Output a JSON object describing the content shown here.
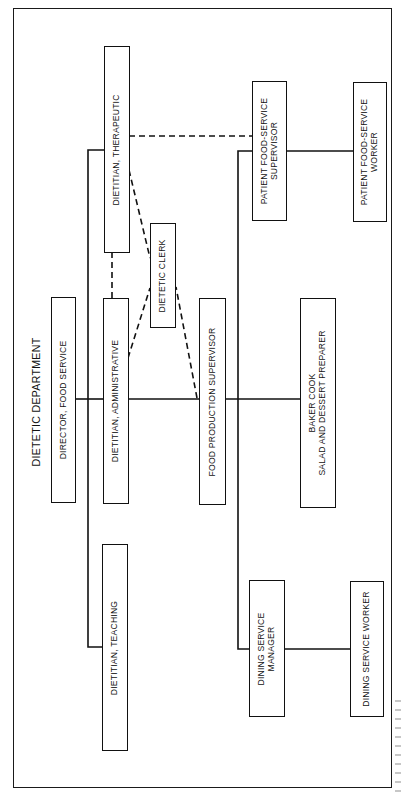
{
  "diagram": {
    "title": "DIETETIC DEPARTMENT",
    "orientation": "rotated 90 degrees counter-clockwise (text reads bottom-to-top)",
    "colors": {
      "line": "#111111",
      "background": "#ffffff"
    },
    "nodes": {
      "director": {
        "label": "DIRECTOR, FOOD SERVICE"
      },
      "dietitian_therapeutic": {
        "label": "DIETITIAN, THERAPEUTIC"
      },
      "dietitian_administrative": {
        "label": "DIETITIAN, ADMINISTRATIVE"
      },
      "dietitian_teaching": {
        "label": "DIETITIAN, TEACHING"
      },
      "dietetic_clerk": {
        "label": "DIETETIC CLERK"
      },
      "food_production_supervisor": {
        "label": "FOOD PRODUCTION SUPERVISOR"
      },
      "patient_food_service_supervisor": {
        "label": "PATIENT FOOD-SERVICE\nSUPERVISOR"
      },
      "patient_food_service_worker": {
        "label": "PATIENT FOOD-SERVICE\nWORKER"
      },
      "baker_cook": {
        "label": "BAKER COOK\nSALAD AND DESSERT PREPARER"
      },
      "dining_service_manager": {
        "label": "DINING SERVICE\nMANAGER"
      },
      "dining_service_worker": {
        "label": "DINING SERVICE WORKER"
      }
    },
    "edges": [
      {
        "from": "director",
        "to": "dietitian_therapeutic",
        "style": "solid"
      },
      {
        "from": "director",
        "to": "dietitian_administrative",
        "style": "solid"
      },
      {
        "from": "director",
        "to": "dietitian_teaching",
        "style": "solid"
      },
      {
        "from": "dietitian_administrative",
        "to": "food_production_supervisor",
        "style": "solid"
      },
      {
        "from": "food_production_supervisor",
        "to": "patient_food_service_supervisor",
        "style": "solid"
      },
      {
        "from": "food_production_supervisor",
        "to": "baker_cook",
        "style": "solid"
      },
      {
        "from": "food_production_supervisor",
        "to": "dining_service_manager",
        "style": "solid"
      },
      {
        "from": "patient_food_service_supervisor",
        "to": "patient_food_service_worker",
        "style": "solid"
      },
      {
        "from": "dining_service_manager",
        "to": "dining_service_worker",
        "style": "solid"
      },
      {
        "from": "dietitian_therapeutic",
        "to": "dietitian_administrative",
        "style": "dashed"
      },
      {
        "from": "dietitian_therapeutic",
        "to": "patient_food_service_supervisor",
        "style": "dashed"
      },
      {
        "from": "dietitian_therapeutic",
        "to": "dietetic_clerk",
        "style": "dashed"
      },
      {
        "from": "dietitian_administrative",
        "to": "dietetic_clerk",
        "style": "dashed"
      },
      {
        "from": "food_production_supervisor",
        "to": "dietetic_clerk",
        "style": "dashed"
      }
    ]
  }
}
